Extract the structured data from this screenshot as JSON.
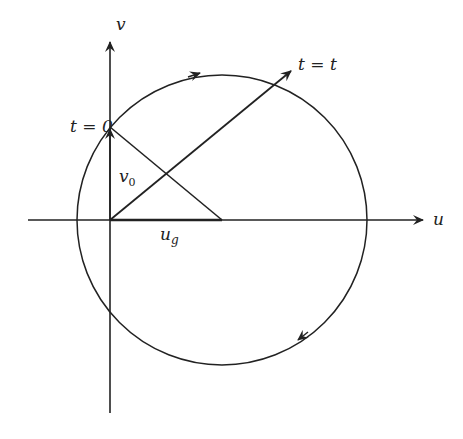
{
  "diagram": {
    "type": "velocity hodograph (inertial oscillation)",
    "axes": {
      "horizontal": {
        "label": "u"
      },
      "vertical": {
        "label": "v"
      }
    },
    "labels": {
      "t0": "t = 0",
      "tt": "t = t",
      "v0": "v",
      "v0_sub": "0",
      "ug": "u",
      "ug_sub": "g"
    },
    "circle": {
      "center_label": "u_g on u-axis",
      "direction": "clockwise"
    },
    "colors": {
      "stroke": "#222222",
      "background": "#ffffff"
    }
  }
}
